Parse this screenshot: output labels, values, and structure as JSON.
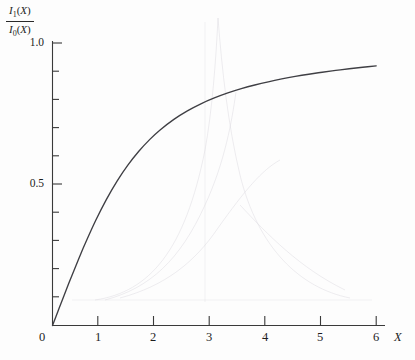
{
  "figure": {
    "background_color": "#fdfdfd",
    "ink_color": "#3a3a3a",
    "curve_color": "#3f3f44"
  },
  "y_axis_label": {
    "numerator_fn": "I",
    "numerator_sub": "1",
    "numerator_arg": "(X)",
    "denominator_fn": "I",
    "denominator_sub": "0",
    "denominator_arg": "(X)"
  },
  "x_axis_label": "X",
  "ticks": {
    "y_labeled": [
      "0.5",
      "1.0"
    ],
    "x_labels": [
      "0",
      "1",
      "2",
      "3",
      "4",
      "5",
      "6"
    ]
  },
  "chart_data": {
    "type": "line",
    "title": "",
    "xlabel": "X",
    "ylabel": "I1(X)/I0(X)",
    "xlim": [
      0,
      6
    ],
    "ylim": [
      0,
      1.0
    ],
    "grid": false,
    "legend": null,
    "x_ticks": [
      0,
      1,
      2,
      3,
      4,
      5,
      6
    ],
    "y_ticks_major": [
      0.5,
      1.0
    ],
    "y_ticks_minor": [
      0.1,
      0.2,
      0.3,
      0.4,
      0.6,
      0.7,
      0.8,
      0.9
    ],
    "series": [
      {
        "name": "I1(X)/I0(X)",
        "x": [
          0,
          0.1,
          0.2,
          0.3,
          0.4,
          0.5,
          0.6,
          0.8,
          1.0,
          1.2,
          1.4,
          1.6,
          1.8,
          2.0,
          2.25,
          2.5,
          2.75,
          3.0,
          3.25,
          3.5,
          3.75,
          4.0,
          4.25,
          4.5,
          4.75,
          5.0,
          5.25,
          5.5,
          5.75,
          6.0
        ],
        "y": [
          0.0,
          0.0499,
          0.0995,
          0.1483,
          0.196,
          0.2425,
          0.2875,
          0.3715,
          0.4464,
          0.5119,
          0.5683,
          0.6167,
          0.658,
          0.693,
          0.7297,
          0.7598,
          0.7847,
          0.8054,
          0.8231,
          0.8382,
          0.8513,
          0.8627,
          0.8727,
          0.8816,
          0.8895,
          0.8966,
          0.9031,
          0.9089,
          0.9142,
          0.919
        ]
      }
    ]
  }
}
